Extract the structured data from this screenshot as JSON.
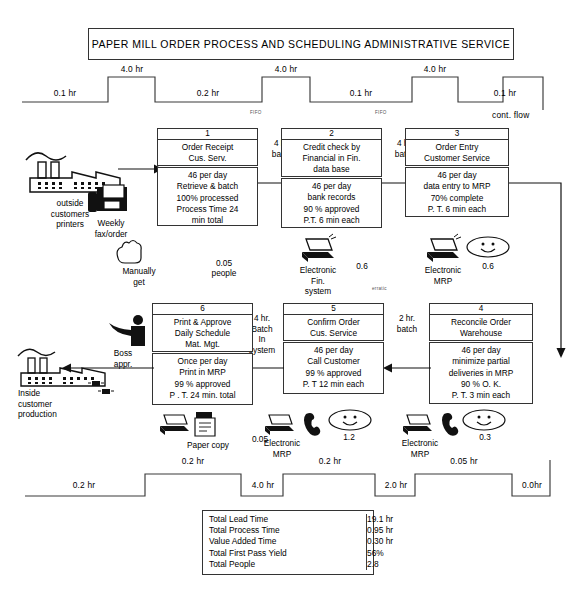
{
  "title": "PAPER MILL ORDER PROCESS AND SCHEDULING ADMINISTRATIVE SERVICE",
  "top_timeline": {
    "segments": [
      {
        "label": "0.1 hr",
        "level": "low"
      },
      {
        "label": "4.0 hr",
        "level": "high"
      },
      {
        "label": "0.2 hr",
        "level": "low"
      },
      {
        "label": "4.0 hr",
        "level": "high"
      },
      {
        "label": "0.1 hr",
        "level": "low"
      },
      {
        "label": "4.0 hr",
        "level": "high"
      },
      {
        "label": "0.1 hr",
        "level": "low"
      }
    ],
    "notes": [
      "FIFO",
      "FIFO"
    ],
    "cont_flow": "cont. flow"
  },
  "bottom_timeline": {
    "segments": [
      {
        "label": "0.2 hr",
        "level": "low"
      },
      {
        "label": "0.2 hr",
        "level": "high"
      },
      {
        "label": "4.0 hr",
        "level": "low"
      },
      {
        "label": "0.2 hr",
        "level": "high"
      },
      {
        "label": "2.0 hr",
        "level": "low"
      },
      {
        "label": "0.05 hr",
        "level": "high"
      },
      {
        "label": "0.0hr",
        "level": "low"
      }
    ]
  },
  "suppliers": {
    "outside": {
      "label": "outside\ncustomers\nprinters",
      "icon": "factory-icon"
    },
    "fax": {
      "label": "Weekly\nfax/order",
      "icon": "fax-machine-icon"
    },
    "inside": {
      "label": "Inside\ncustomer\nproduction",
      "icon": "factory-icon"
    }
  },
  "flow_arrows": [
    {
      "id": "a1",
      "label": "4 hr.\nbatch"
    },
    {
      "id": "a2",
      "label": "4 hr.\nbatch"
    },
    {
      "id": "a3",
      "label": "4 hr.\nbatch"
    },
    {
      "id": "a4",
      "label": "2 hr.\nbatch"
    },
    {
      "id": "a5",
      "label": "4 hr.\nBatch\nIn\nsystem"
    },
    {
      "id": "erratic",
      "label": "erratic"
    }
  ],
  "processes": [
    {
      "number": "1",
      "name": "Order Receipt\nCus. Serv.",
      "data": "46 per day\nRetrieve & batch\n100% processed\nProcess Time 24\nmin total"
    },
    {
      "number": "2",
      "name": "Credit check by\nFinancial in Fin.\ndata base",
      "data": "46 per day\nbank records\n90 % approved\nP.T. 6 min each"
    },
    {
      "number": "3",
      "name": "Order Entry\nCustomer Service",
      "data": "46 per day\ndata entry to MRP\n70% complete\nP. T.  6 min each"
    },
    {
      "number": "4",
      "name": "Reconcile Order\nWarehouse",
      "data": "46 per day\nminimize partial\ndeliveries in MRP\n90 % O. K.\nP. T. 3 min each"
    },
    {
      "number": "5",
      "name": "Confirm Order\nCus. Service",
      "data": "46 per day\nCall Customer\n99 % approved\nP. T  12 min each"
    },
    {
      "number": "6",
      "name": "Print &  Approve\nDaily Schedule\nMat. Mgt.",
      "data": "Once per day\nPrint in MRP\n99 % approved\nP . T. 24 min. total"
    }
  ],
  "resources": [
    {
      "id": "r1",
      "icon": "hand-icon",
      "label": "Manually\nget",
      "people": "0.05",
      "people_unit": "people"
    },
    {
      "id": "r2",
      "icon": "computer-icon",
      "label": "Electronic\nFin.\nsystem",
      "people": "0.6"
    },
    {
      "id": "r3",
      "icon": "computer-icon",
      "label": "Electronic\nMRP",
      "people": "0.6",
      "smiley": true
    },
    {
      "id": "r4",
      "icon": "computer-icon",
      "label": "Electronic\nMRP",
      "people": "0.3",
      "smiley": true,
      "phone": true
    },
    {
      "id": "r5",
      "icon": "computer-icon",
      "label": "Electronic\nMRP",
      "people": "1.2",
      "smiley": true,
      "phone": true
    },
    {
      "id": "r6",
      "icon": "paper-icon",
      "label": "Paper copy",
      "people": "0.05"
    },
    {
      "id": "r7",
      "icon": "person-icon",
      "label": "Boss\nappr."
    }
  ],
  "summary": {
    "rows": [
      {
        "key": "Total Lead Time",
        "value": "19.1 hr"
      },
      {
        "key": "Total Process Time",
        "value": "0.95 hr"
      },
      {
        "key": "Value Added Time",
        "value": "0.30 hr"
      },
      {
        "key": "Total First Pass Yield",
        "value": "56%"
      },
      {
        "key": "Total People",
        "value": "2.8"
      }
    ]
  }
}
